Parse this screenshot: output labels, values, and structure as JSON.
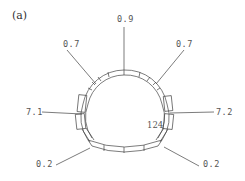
{
  "figure": {
    "panel_label": "(a)",
    "center_value": "124",
    "callouts": [
      {
        "id": "top",
        "label": "0.9"
      },
      {
        "id": "upper-left",
        "label": "0.7"
      },
      {
        "id": "upper-right",
        "label": "0.7"
      },
      {
        "id": "left",
        "label": "7.1"
      },
      {
        "id": "right",
        "label": "7.2"
      },
      {
        "id": "lower-left",
        "label": "0.2"
      },
      {
        "id": "lower-right",
        "label": "0.2"
      }
    ],
    "colors": {
      "stroke": "#444444",
      "text": "#555555",
      "background": "#ffffff"
    }
  }
}
